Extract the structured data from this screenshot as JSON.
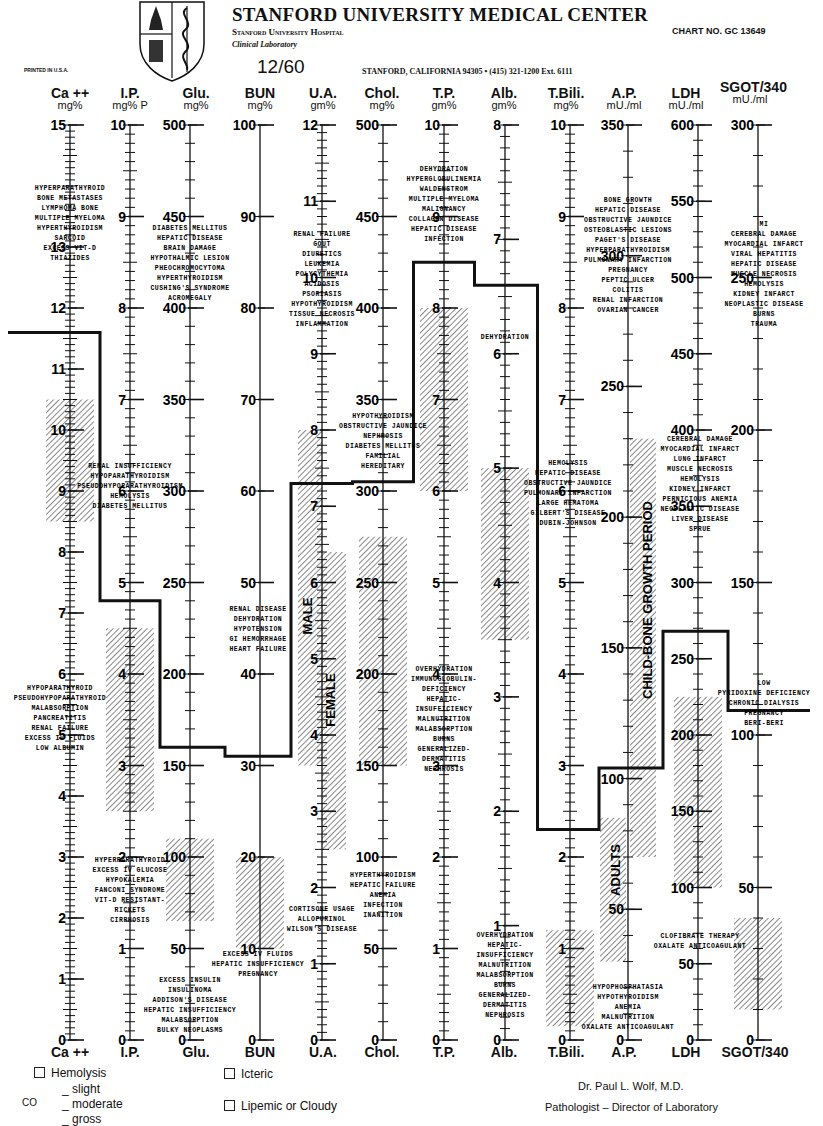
{
  "header": {
    "institution": "STANFORD UNIVERSITY MEDICAL CENTER",
    "hospital": "Stanford University Hospital",
    "department": "Clinical Laboratory",
    "chart_number": "CHART NO. GC 13649",
    "printed": "PRINTED IN U.S.A.",
    "date": "12/60",
    "address": "STANFORD, CALIFORNIA 94305 • (415) 321-1200 Ext. 6111"
  },
  "columns": [
    {
      "name": "Ca ++",
      "unit": "mg%"
    },
    {
      "name": "I.P.",
      "unit": "mg% P"
    },
    {
      "name": "Glu.",
      "unit": "mg%"
    },
    {
      "name": "BUN",
      "unit": "mg%"
    },
    {
      "name": "U.A.",
      "unit": "gm%"
    },
    {
      "name": "Chol.",
      "unit": "mg%"
    },
    {
      "name": "T.P.",
      "unit": "gm%"
    },
    {
      "name": "Alb.",
      "unit": "gm%"
    },
    {
      "name": "T.Bili.",
      "unit": "mg%"
    },
    {
      "name": "A.P.",
      "unit": "mU./ml"
    },
    {
      "name": "LDH",
      "unit": "mU./ml"
    },
    {
      "name": "SGOT/340",
      "unit": "mU./ml"
    }
  ],
  "footer_labels": [
    "Ca ++",
    "I.P.",
    "Glu.",
    "BUN",
    "U.A.",
    "Chol.",
    "T.P.",
    "Alb.",
    "T.Bili.",
    "A.P.",
    "LDH",
    "SGOT/340"
  ],
  "legend": {
    "hemolysis": "Hemolysis",
    "slight": "_ slight",
    "moderate": "_ moderate",
    "gross": "_ gross",
    "icteric": "Icteric",
    "lipemic": "Lipemic or Cloudy",
    "side_mark": "CO"
  },
  "signature": {
    "name": "Dr. Paul L. Wolf, M.D.",
    "title": "Pathologist – Director of Laboratory"
  },
  "vertical_labels": {
    "male": "MALE",
    "female": "FEMALE",
    "child": "CHILD-BONE GROWTH PERIOD",
    "adults": "ADULTS"
  },
  "chart_data": {
    "type": "line",
    "categories": [
      "Ca++",
      "I.P.",
      "Glu.",
      "BUN",
      "U.A.",
      "Chol.",
      "T.P.",
      "Alb.",
      "T.Bili.",
      "A.P.",
      "LDH",
      "SGOT/340"
    ],
    "units": [
      "mg%",
      "mg% P",
      "mg%",
      "mg%",
      "gm%",
      "mg%",
      "gm%",
      "gm%",
      "mg%",
      "mU./ml",
      "mU./ml",
      "mU./ml"
    ],
    "axis_ranges": [
      [
        0,
        15
      ],
      [
        0,
        10
      ],
      [
        0,
        500
      ],
      [
        0,
        100
      ],
      [
        0,
        12
      ],
      [
        0,
        500
      ],
      [
        0,
        10
      ],
      [
        0,
        8
      ],
      [
        0,
        10
      ],
      [
        0,
        350
      ],
      [
        0,
        600
      ],
      [
        0,
        300
      ]
    ],
    "axis_ticks": [
      [
        0,
        1,
        2,
        3,
        4,
        5,
        6,
        7,
        8,
        9,
        10,
        11,
        12,
        13,
        15
      ],
      [
        0,
        1,
        2,
        3,
        4,
        5,
        6,
        7,
        8,
        9,
        10
      ],
      [
        0,
        50,
        100,
        150,
        200,
        250,
        300,
        350,
        400,
        450,
        500
      ],
      [
        0,
        10,
        20,
        30,
        40,
        50,
        60,
        70,
        80,
        90,
        100
      ],
      [
        0,
        1,
        2,
        3,
        4,
        5,
        6,
        7,
        8,
        9,
        10,
        11,
        12
      ],
      [
        0,
        50,
        100,
        150,
        200,
        250,
        300,
        350,
        400,
        450,
        500
      ],
      [
        0,
        1,
        2,
        3,
        4,
        5,
        6,
        7,
        8,
        9,
        10
      ],
      [
        0,
        1,
        2,
        3,
        4,
        5,
        6,
        7,
        8
      ],
      [
        0,
        1,
        2,
        3,
        4,
        5,
        6,
        7,
        8,
        9,
        10
      ],
      [
        0,
        50,
        100,
        150,
        200,
        250,
        300,
        350
      ],
      [
        0,
        50,
        100,
        150,
        200,
        250,
        300,
        350,
        400,
        450,
        500,
        550,
        600
      ],
      [
        0,
        50,
        100,
        150,
        200,
        250,
        300
      ]
    ],
    "series": [
      {
        "name": "Patient result (step line)",
        "values": [
          11.6,
          4.8,
          160,
          31,
          7.3,
          305,
          8.5,
          6.6,
          2.3,
          104,
          268,
          108
        ]
      }
    ],
    "normal_ranges": [
      {
        "test": "Ca++",
        "range": [
          8.5,
          10.5
        ]
      },
      {
        "test": "I.P.",
        "range": [
          2.5,
          4.5
        ]
      },
      {
        "test": "Glu.",
        "range": [
          65,
          110
        ]
      },
      {
        "test": "BUN",
        "range": [
          10,
          20
        ]
      },
      {
        "test": "U.A.",
        "range": [
          3.0,
          8.0
        ],
        "male": [
          3.6,
          8.0
        ],
        "female": [
          2.5,
          6.4
        ]
      },
      {
        "test": "Chol.",
        "range": [
          150,
          275
        ]
      },
      {
        "test": "T.P.",
        "range": [
          6.0,
          8.0
        ]
      },
      {
        "test": "Alb.",
        "range": [
          3.5,
          5.0
        ]
      },
      {
        "test": "T.Bili.",
        "range": [
          0.15,
          1.2
        ]
      },
      {
        "test": "A.P.",
        "adults": [
          30,
          85
        ],
        "child_bone_growth": [
          70,
          230
        ]
      },
      {
        "test": "LDH",
        "range": [
          100,
          225
        ]
      },
      {
        "test": "SGOT/340",
        "range": [
          10,
          40
        ]
      }
    ],
    "annotations": [
      {
        "test": "Ca++",
        "position": "high",
        "lines": [
          "HYPERPARATHYROID",
          "BONE METASTASES",
          "LYMPHOMA BONE",
          "MULTIPLE MYELOMA",
          "HYPERTHYROIDISM",
          "SARCOID",
          "EXCESS VIT-D",
          "THIAZIDES"
        ]
      },
      {
        "test": "Ca++",
        "position": "low",
        "lines": [
          "HYPOPARATHYROID",
          "PSEUDOHYPOPARATHYROID",
          "MALABSORPTION",
          "PANCREATITIS",
          "RENAL FAILURE",
          "EXCESS IV FLUIDS",
          "LOW ALBUMIN"
        ]
      },
      {
        "test": "I.P.",
        "position": "high",
        "lines": [
          "RENAL INSUFFICIENCY",
          "HYPOPARATHYROIDISM",
          "PSEUDOHYPOPARATHYROIDISM",
          "HEMOLYSIS",
          "DIABETES MELLITUS"
        ]
      },
      {
        "test": "I.P.",
        "position": "low",
        "lines": [
          "HYPERPARATHYROID",
          "EXCESS IV GLUCOSE",
          "HYPOKALEMIA",
          "FANCONI SYNDROME",
          "VIT-D RESISTANT-",
          "RICKETS",
          "CIRRHOSIS"
        ]
      },
      {
        "test": "Glu.",
        "position": "high",
        "lines": [
          "DIABETES MELLITUS",
          "HEPATIC DISEASE",
          "BRAIN DAMAGE",
          "HYPOTHALMIC LESION",
          "PHEOCHROMOCYTOMA",
          "HYPERTHYROIDISM",
          "CUSHING'S SYNDROME",
          "ACROMEGALY"
        ]
      },
      {
        "test": "Glu.",
        "position": "low",
        "lines": [
          "EXCESS INSULIN",
          "INSULINOMA",
          "ADDISON'S DISEASE",
          "HEPATIC INSUFFICIENCY",
          "MALABSORPTION",
          "BULKY NEOPLASMS"
        ]
      },
      {
        "test": "BUN",
        "position": "high",
        "lines": [
          "RENAL DISEASE",
          "DEHYDRATION",
          "HYPOTENSION",
          "GI HEMORRHAGE",
          "HEART FAILURE"
        ]
      },
      {
        "test": "BUN",
        "position": "low",
        "lines": [
          "EXCESS IV FLUIDS",
          "HEPATIC INSUFFICIENCY",
          "PREGNANCY"
        ]
      },
      {
        "test": "U.A.",
        "position": "high",
        "lines": [
          "RENAL FAILURE",
          "GOUT",
          "DIURETICS",
          "LEUKEMIA",
          "POLYCYTHEMIA",
          "ACIDOSIS",
          "PSORIASIS",
          "HYPOTHYROIDISM",
          "TISSUE NECROSIS",
          "INFLAMMATION"
        ]
      },
      {
        "test": "U.A.",
        "position": "low",
        "lines": [
          "CORTISONE USAGE",
          "ALLOPURINOL",
          "WILSON'S DISEASE"
        ]
      },
      {
        "test": "Chol.",
        "position": "high",
        "lines": [
          "HYPOTHYROIDISM",
          "OBSTRUCTIVE JAUNDICE",
          "NEPHROSIS",
          "DIABETES MELLITUS",
          "FAMILIAL",
          "HEREDITARY"
        ]
      },
      {
        "test": "Chol.",
        "position": "low",
        "lines": [
          "HYPERTHYROIDISM",
          "HEPATIC FAILURE",
          "ANEMIA",
          "INFECTION",
          "INANITION"
        ]
      },
      {
        "test": "T.P.",
        "position": "high",
        "lines": [
          "DEHYDRATION",
          "HYPERGLOBULINEMIA",
          "WALDENSTROM",
          "MULTIPLE MYELOMA",
          "MALIGNANCY",
          "COLLAGEN DISEASE",
          "HEPATIC DISEASE",
          "INFECTION"
        ]
      },
      {
        "test": "T.P.",
        "position": "low",
        "lines": [
          "OVERHYDRATION",
          "IMMUNOGLOBULIN-",
          "DEFICIENCY",
          "HEPATIC-",
          "INSUFFICIENCY",
          "MALNUTRITION",
          "MALABSORPTION",
          "BURNS",
          "GENERALIZED-",
          "DERMATITIS",
          "NEPHROSIS"
        ]
      },
      {
        "test": "Alb.",
        "position": "high",
        "lines": [
          "DEHYDRATION"
        ]
      },
      {
        "test": "Alb.",
        "position": "low",
        "lines": [
          "OVERHYDRATION",
          "HEPATIC-",
          "INSUFFICIENCY",
          "MALNUTRITION",
          "MALABSORPTION",
          "BURNS",
          "GENERALIZED-",
          "DERMATITIS",
          "NEPHROSIS"
        ]
      },
      {
        "test": "T.Bili.",
        "position": "high",
        "lines": [
          "HEMOLYSIS",
          "HEPATIC DISEASE",
          "OBSTRUCTIVE JAUNDICE",
          "PULMONARY INFARCTION",
          "LARGE HEMATOMA",
          "GILBERT'S DISEASE",
          "DUBIN-JOHNSON"
        ]
      },
      {
        "test": "A.P.",
        "position": "high",
        "lines": [
          "BONE GROWTH",
          "HEPATIC DISEASE",
          "OBSTRUCTIVE JAUNDICE",
          "OSTEOBLASTIC LESIONS",
          "PAGET'S DISEASE",
          "HYPERPARATHYROIDISM",
          "PULMONARY INFARCTION",
          "PREGNANCY",
          "PEPTIC ULCER",
          "COLITIS",
          "RENAL INFARCTION",
          "OVARIAN CANCER"
        ]
      },
      {
        "test": "A.P.",
        "position": "low",
        "lines": [
          "HYPOPHOSPHATASIA",
          "HYPOTHYROIDISM",
          "ANEMIA",
          "MALNUTRITION",
          "OXALATE ANTICOAGULANT"
        ]
      },
      {
        "test": "LDH",
        "position": "high",
        "lines": [
          "CEREBRAL DAMAGE",
          "MYOCARDIAL INFARCT",
          "LUNG INFARCT",
          "MUSCLE NECROSIS",
          "HEMOLYSIS",
          "KIDNEY INFARCT",
          "PERNICIOUS ANEMIA",
          "NEOPLASTIC DISEASE",
          "LIVER DISEASE",
          "SPRUE"
        ]
      },
      {
        "test": "LDH",
        "position": "low",
        "lines": [
          "CLOFIBRATE THERAPY",
          "OXALATE ANTICOAGULANT"
        ]
      },
      {
        "test": "SGOT/340",
        "position": "high",
        "lines": [
          "MI",
          "CEREBRAL DAMAGE",
          "MYOCARDIAL INFARCT",
          "VIRAL HEPATITIS",
          "HEPATIC DISEASE",
          "MUSCLE NECROSIS",
          "HEMOLYSIS",
          "KIDNEY INFARCT",
          "NEOPLASTIC DISEASE",
          "BURNS",
          "TRAUMA"
        ]
      },
      {
        "test": "SGOT/340",
        "position": "low",
        "lines": [
          "LOW",
          "PYRIDOXINE DEFICIENCY",
          "CHRONIC DIALYSIS",
          "PREGNANCY",
          "BERI-BERI"
        ]
      }
    ],
    "xlabel": "",
    "ylabel": "",
    "grid": false,
    "legend_position": "none"
  }
}
